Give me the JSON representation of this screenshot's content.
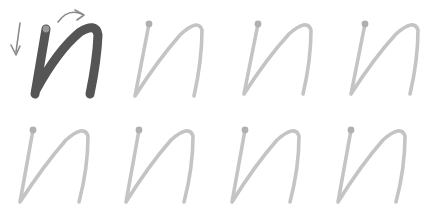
{
  "worksheet": {
    "letter": "n",
    "model": {
      "label": "model letter n",
      "stroke_color": "#555555",
      "dot_color": "#9a9a9a",
      "arrow_color": "#8a8a8a"
    },
    "tracing": {
      "stroke_color": "#c4c4c4",
      "dot_color": "#b0b0b0",
      "count": 7
    },
    "rows": [
      {
        "cells": [
          "model",
          "trace",
          "trace",
          "trace"
        ]
      },
      {
        "cells": [
          "trace",
          "trace",
          "trace",
          "trace"
        ]
      }
    ]
  }
}
